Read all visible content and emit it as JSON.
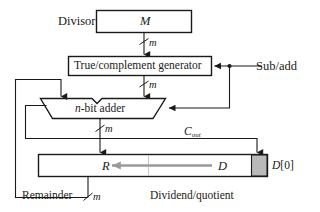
{
  "diagram": {
    "blocks": {
      "divisor_label": "Divisor",
      "divisor_register": "M",
      "generator": "True/complement generator",
      "adder_prefix": "n",
      "adder_suffix": "-bit adder",
      "register_left": "R",
      "register_right": "D",
      "remainder_label": "Remainder",
      "dividend_label": "Dividend/quotient",
      "d0_label_base": "D",
      "d0_label_index": "[0]"
    },
    "signals": {
      "sub_add": "Sub/add",
      "carry_out_base": "C",
      "carry_out_sub": "out",
      "width_divisor": "m",
      "width_generator_out": "m",
      "width_adder_out": "m",
      "width_remainder": "m"
    },
    "colors": {
      "line": "#1a1a1a",
      "box_fill": "#ffffff",
      "shaded_cell": "#b9b9b9",
      "shift_arrow": "#9a9a9a",
      "divider": "#c9c9c9",
      "text": "#1a1a1a"
    }
  }
}
